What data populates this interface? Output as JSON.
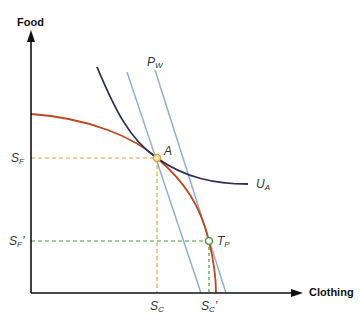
{
  "axes": {
    "y_title": "Food",
    "x_title": "Clothing"
  },
  "labels": {
    "pw": {
      "main": "P",
      "sub": "W"
    },
    "ua": {
      "main": "U",
      "sub": "A"
    },
    "a": "A",
    "tp": {
      "main": "T",
      "sub": "P"
    },
    "sf": {
      "main": "S",
      "sub": "F",
      "prime": ""
    },
    "sf_prime": {
      "main": "S",
      "sub": "F",
      "prime": "’"
    },
    "sc": {
      "main": "S",
      "sub": "C",
      "prime": ""
    },
    "sc_prime": {
      "main": "S",
      "sub": "C",
      "prime": "’"
    }
  },
  "colors": {
    "axis": "#111111",
    "ppf": "#c0461f",
    "indifference": "#2b2f5e",
    "price_lines": "#8fb0cf",
    "guide_autarky": "#e8a040",
    "guide_trade": "#4a9a3a"
  },
  "diagram": {
    "type": "economics-ppf-trade",
    "curves": [
      {
        "name": "Production possibilities frontier",
        "color": "#c0461f"
      },
      {
        "name": "Indifference curve U_A",
        "color": "#2b2f5e"
      },
      {
        "name": "World price line P_W (through A)",
        "color": "#8fb0cf"
      },
      {
        "name": "World price line P_W (through T_P)",
        "color": "#8fb0cf"
      }
    ],
    "points": [
      {
        "name": "A",
        "x_label": "S_C",
        "y_label": "S_F"
      },
      {
        "name": "T_P",
        "x_label": "S_C'",
        "y_label": "S_F'"
      }
    ]
  }
}
